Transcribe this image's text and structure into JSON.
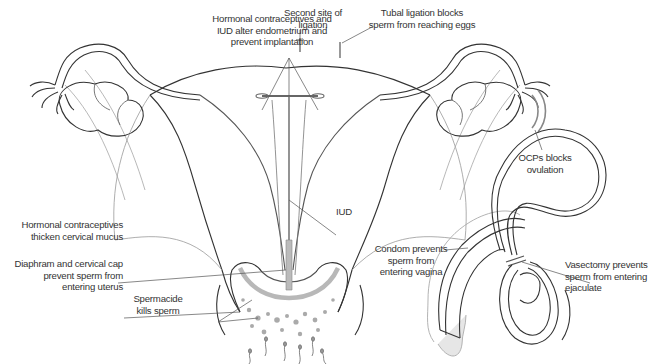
{
  "diagram": {
    "female_labels": {
      "hormonal_iud": [
        "Hormonal contraceptives and",
        "IUD alter endometrium and",
        "prevent implantation"
      ],
      "second_ligation": [
        "Second site of",
        "ligation"
      ],
      "tubal_ligation": [
        "Tubal ligation blocks",
        "sperm from reaching eggs"
      ],
      "ocps": [
        "OCPs blocks",
        "ovulation"
      ],
      "iud": [
        "IUD"
      ],
      "cervical_mucus": [
        "Hormonal contraceptives",
        "thicken cervical mucus"
      ],
      "diaphragm": [
        "Diaphram and cervical cap",
        "prevent sperm from",
        "entering uterus"
      ],
      "spermacide": [
        "Spermacide",
        "kills sperm"
      ]
    },
    "male_labels": {
      "condom": [
        "Condom prevents",
        "sperm from",
        "entering vagina"
      ],
      "vasectomy": [
        "Vasectomy prevents",
        "sperm from entering",
        "ejaculate"
      ]
    },
    "colors": {
      "line": "#333333",
      "grey_line": "#999999",
      "diaphragm": "#b8b8b8",
      "condom_fill": "#e6e6e6"
    }
  }
}
